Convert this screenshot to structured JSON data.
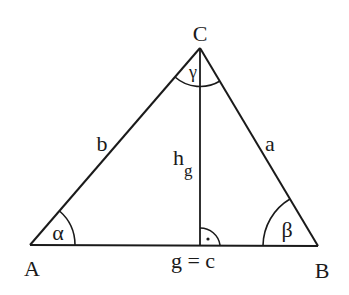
{
  "diagram": {
    "type": "triangle-with-altitude",
    "vertices": {
      "A": {
        "label": "A",
        "x": 30,
        "y": 245
      },
      "B": {
        "label": "B",
        "x": 318,
        "y": 246
      },
      "C": {
        "label": "C",
        "x": 200,
        "y": 48
      }
    },
    "sides": {
      "a": {
        "label": "a"
      },
      "b": {
        "label": "b"
      },
      "base": {
        "label": "g = c"
      }
    },
    "altitude": {
      "label_main": "h",
      "label_sub": "g"
    },
    "angles": {
      "alpha": {
        "label": "α"
      },
      "beta": {
        "label": "β"
      },
      "gamma": {
        "label": "γ"
      }
    },
    "right_angle_marker": {
      "symbol": "·"
    },
    "colors": {
      "stroke": "#1a1a1a",
      "background": "#ffffff"
    }
  }
}
